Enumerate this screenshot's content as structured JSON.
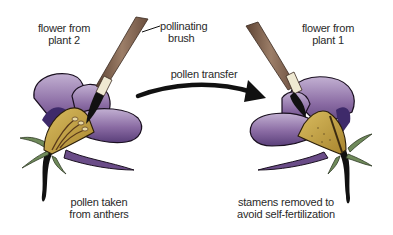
{
  "diagram": {
    "labels": {
      "flower_left": [
        "flower from",
        "plant 2"
      ],
      "brush": [
        "pollinating",
        "brush"
      ],
      "transfer": "pollen transfer",
      "flower_right": [
        "flower from",
        "plant 1"
      ],
      "bottom_left": [
        "pollen taken",
        "from anthers"
      ],
      "bottom_right": [
        "stamens removed to",
        "avoid self-fertilization"
      ]
    },
    "colors": {
      "petal": "#7a5a92",
      "petal_light": "#b8a3c8",
      "petal_dark": "#3e2a6a",
      "anther_cup": "#c9a84a",
      "stem": "#111111",
      "sepal": "#6f8a5a",
      "brush_handle": "#8a6a55",
      "ferrule": "#efe9d2",
      "arrow": "#111111"
    }
  }
}
